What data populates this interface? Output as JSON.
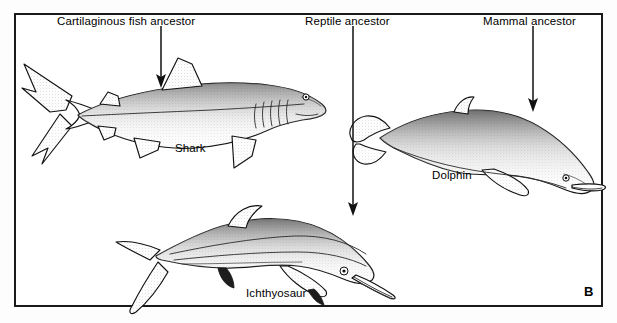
{
  "figure": {
    "panel_letter": "B",
    "frame_color": "#1a1a1a",
    "background_color": "#ffffff",
    "ink_color": "#111111"
  },
  "ancestors": [
    {
      "id": "cartilaginous-fish",
      "label": "Cartilaginous fish ancestor",
      "label_x": 57,
      "label_y": 16,
      "arrow_x": 160,
      "arrow_top": 28,
      "arrow_bottom": 86
    },
    {
      "id": "reptile",
      "label": "Reptile ancestor",
      "label_x": 305,
      "label_y": 16,
      "arrow_x": 352,
      "arrow_top": 28,
      "arrow_bottom": 214
    },
    {
      "id": "mammal",
      "label": "Mammal ancestor",
      "label_x": 483,
      "label_y": 16,
      "arrow_x": 532,
      "arrow_top": 28,
      "arrow_bottom": 110
    }
  ],
  "organisms": [
    {
      "id": "shark",
      "label": "Shark",
      "label_x": 175,
      "label_y": 143,
      "ancestor": "cartilaginous-fish"
    },
    {
      "id": "dolphin",
      "label": "Dolphin",
      "label_x": 432,
      "label_y": 170,
      "ancestor": "mammal"
    },
    {
      "id": "ichthyosaur",
      "label": "Ichthyosaur",
      "label_x": 246,
      "label_y": 288,
      "ancestor": "reptile"
    }
  ],
  "panel": {
    "letter_x": 584,
    "letter_y": 285
  }
}
